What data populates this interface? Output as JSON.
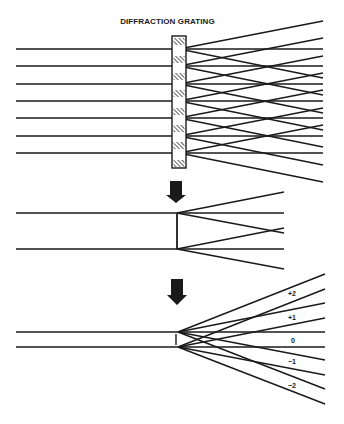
{
  "title": "DIFFRACTION GRATING",
  "colors": {
    "ink": "#1a1a1a",
    "background": "#ffffff"
  },
  "diagrams": [
    {
      "name": "multi-slit grating",
      "beams_y": [
        49,
        66,
        84,
        101,
        118,
        136,
        153
      ],
      "beam_start_x": 16,
      "grating_x": 179,
      "ray_end_x": 323,
      "ray_offsets": [
        -28,
        0,
        29
      ]
    },
    {
      "name": "double slit",
      "beams_y": [
        213,
        249
      ],
      "beam_start_x": 16,
      "slit_x": 177,
      "ray_end_x": 284,
      "ray_offsets": [
        -21,
        0,
        20
      ]
    },
    {
      "name": "diffraction orders",
      "beams_y": [
        332,
        347
      ],
      "beam_start_x": 16,
      "slit_x": 178,
      "ray_end_x": 325,
      "ray_offsets": [
        -58,
        -29,
        0,
        28,
        57
      ]
    }
  ],
  "order_labels": [
    {
      "text": "+2",
      "x": 288,
      "y": 290
    },
    {
      "text": "+1",
      "x": 288,
      "y": 314
    },
    {
      "text": "0",
      "x": 291,
      "y": 337
    },
    {
      "text": "−1",
      "x": 288,
      "y": 358
    },
    {
      "text": "−2",
      "x": 288,
      "y": 382
    }
  ]
}
